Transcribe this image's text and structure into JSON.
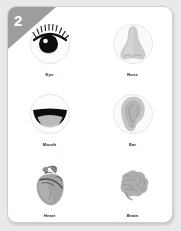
{
  "page": {
    "background_color": "#e9e9e9",
    "card_background": "#ffffff",
    "card_border_color": "#cfcfcf"
  },
  "ribbon": {
    "number": "2",
    "color": "#9d9d9d",
    "text_color": "#ffffff"
  },
  "items": [
    {
      "id": "eye",
      "label": "Eye",
      "icon": "eye-illustration",
      "has_circle_background": true,
      "circle_color": "#fdfdfd",
      "circle_stroke": "#d9d9d9",
      "accent_color": "#111111"
    },
    {
      "id": "nose",
      "label": "Nose",
      "icon": "nose-illustration",
      "has_circle_background": true,
      "circle_color": "#fafafa",
      "circle_stroke": "#dedede",
      "accent_color": "#c9c9c9"
    },
    {
      "id": "mouth",
      "label": "Mouth",
      "icon": "mouth-illustration",
      "has_circle_background": true,
      "circle_color": "#fdfdfd",
      "circle_stroke": "#d9d9d9",
      "accent_color": "#0d0d0d"
    },
    {
      "id": "ear",
      "label": "Ear",
      "icon": "ear-illustration",
      "has_circle_background": true,
      "circle_color": "#fafafa",
      "circle_stroke": "#dedede",
      "accent_color": "#c2c2c2"
    },
    {
      "id": "heart",
      "label": "Heart",
      "icon": "heart-anatomical-illustration",
      "has_circle_background": false,
      "circle_color": "",
      "circle_stroke": "",
      "accent_color": "#9a9a9a"
    },
    {
      "id": "brain",
      "label": "Brain",
      "icon": "brain-anatomical-illustration",
      "has_circle_background": false,
      "circle_color": "",
      "circle_stroke": "",
      "accent_color": "#a8a8a8"
    }
  ]
}
